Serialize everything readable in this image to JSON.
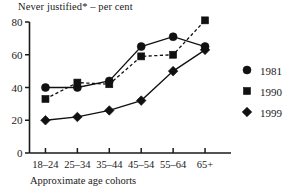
{
  "chart_data": {
    "type": "line",
    "title": "Never justified* – per cent",
    "xlabel": "Approximate age cohorts",
    "ylabel": "",
    "categories": [
      "18–24",
      "25–34",
      "35–44",
      "45–54",
      "55–64",
      "65+"
    ],
    "ylim": [
      0,
      80
    ],
    "yticks": [
      0,
      20,
      40,
      60,
      80
    ],
    "ytick_labels": [
      "0",
      "20",
      "40",
      "60",
      "80"
    ],
    "grid": false,
    "legend_position": "right",
    "series": [
      {
        "name": "1981",
        "marker": "circle",
        "linestyle": "solid",
        "color": "#111111",
        "values": [
          40,
          40,
          44,
          65,
          71,
          65
        ]
      },
      {
        "name": "1990",
        "marker": "square",
        "linestyle": "dashed",
        "color": "#111111",
        "values": [
          33,
          43,
          42,
          59,
          60,
          81
        ]
      },
      {
        "name": "1999",
        "marker": "diamond",
        "linestyle": "solid",
        "color": "#111111",
        "values": [
          20,
          22,
          26,
          32,
          50,
          63
        ]
      }
    ]
  },
  "legend": {
    "entries": [
      {
        "label": "1981",
        "marker": "circle"
      },
      {
        "label": "1990",
        "marker": "square"
      },
      {
        "label": "1999",
        "marker": "diamond"
      }
    ]
  },
  "colors": {
    "ink": "#111111",
    "background": "#ffffff"
  }
}
